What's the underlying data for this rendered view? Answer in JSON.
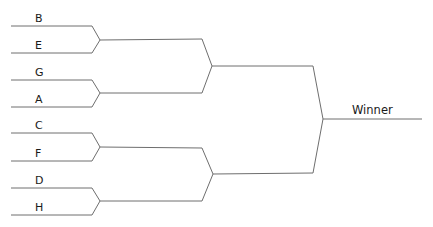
{
  "bracket": {
    "round1": {
      "entries": [
        "B",
        "E",
        "G",
        "A",
        "C",
        "F",
        "D",
        "H"
      ]
    },
    "final": {
      "label": "Winner"
    }
  },
  "colors": {
    "line": "#6e6e6e",
    "text": "#1a1a1a",
    "background": "#ffffff"
  }
}
